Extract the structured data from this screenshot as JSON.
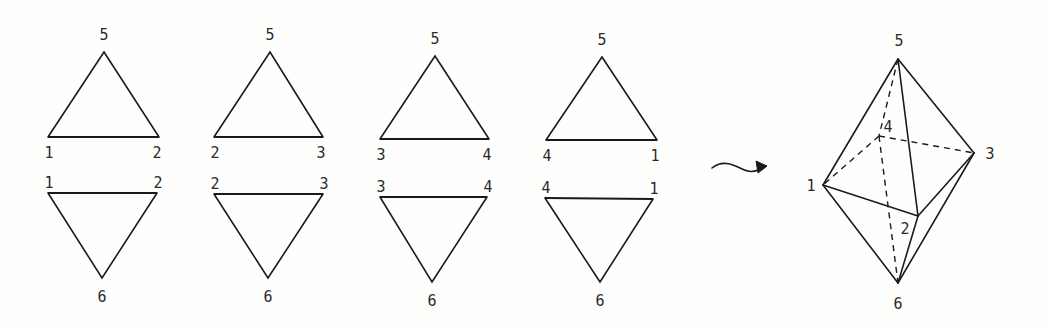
{
  "figure": {
    "nets": [
      {
        "upper": {
          "apex": {
            "label": "5",
            "x": 104,
            "y": 52
          },
          "left": {
            "label": "1",
            "x": 48,
            "y": 137
          },
          "right": {
            "label": "2",
            "x": 159,
            "y": 137
          }
        },
        "lower": {
          "left": {
            "label": "1",
            "x": 48,
            "y": 193
          },
          "right": {
            "label": "2",
            "x": 157,
            "y": 193
          },
          "bottom": {
            "label": "6",
            "x": 102,
            "y": 278
          }
        }
      },
      {
        "upper": {
          "apex": {
            "label": "5",
            "x": 270,
            "y": 52
          },
          "left": {
            "label": "2",
            "x": 214,
            "y": 137
          },
          "right": {
            "label": "3",
            "x": 323,
            "y": 137
          }
        },
        "lower": {
          "left": {
            "label": "2",
            "x": 214,
            "y": 194
          },
          "right": {
            "label": "3",
            "x": 323,
            "y": 194
          },
          "bottom": {
            "label": "6",
            "x": 268,
            "y": 278
          }
        }
      },
      {
        "upper": {
          "apex": {
            "label": "5",
            "x": 435,
            "y": 56
          },
          "left": {
            "label": "3",
            "x": 380,
            "y": 139
          },
          "right": {
            "label": "4",
            "x": 489,
            "y": 139
          }
        },
        "lower": {
          "left": {
            "label": "3",
            "x": 380,
            "y": 197
          },
          "right": {
            "label": "4",
            "x": 487,
            "y": 197
          },
          "bottom": {
            "label": "6",
            "x": 432,
            "y": 282
          }
        }
      },
      {
        "upper": {
          "apex": {
            "label": "5",
            "x": 602,
            "y": 57
          },
          "left": {
            "label": "4",
            "x": 546,
            "y": 140
          },
          "right": {
            "label": "1",
            "x": 657,
            "y": 140
          }
        },
        "lower": {
          "left": {
            "label": "4",
            "x": 545,
            "y": 198
          },
          "right": {
            "label": "1",
            "x": 653,
            "y": 199
          },
          "bottom": {
            "label": "6",
            "x": 600,
            "y": 282
          }
        }
      }
    ],
    "arrow": {
      "symbol": "wavy-arrow",
      "from": [
        712,
        168
      ],
      "to": [
        766,
        168
      ]
    },
    "octahedron": {
      "vertices": {
        "5": {
          "x": 898,
          "y": 59
        },
        "4": {
          "x": 879,
          "y": 136
        },
        "3": {
          "x": 974,
          "y": 153
        },
        "1": {
          "x": 823,
          "y": 185
        },
        "2": {
          "x": 918,
          "y": 216
        },
        "6": {
          "x": 898,
          "y": 283
        }
      },
      "solid_edges": [
        [
          "5",
          "1"
        ],
        [
          "5",
          "2"
        ],
        [
          "5",
          "3"
        ],
        [
          "1",
          "2"
        ],
        [
          "2",
          "3"
        ],
        [
          "1",
          "6"
        ],
        [
          "2",
          "6"
        ],
        [
          "3",
          "6"
        ]
      ],
      "hidden_edges": [
        [
          "5",
          "4"
        ],
        [
          "4",
          "1"
        ],
        [
          "4",
          "3"
        ],
        [
          "4",
          "6"
        ]
      ],
      "labels": {
        "5": "5",
        "4": "4",
        "3": "3",
        "1": "1",
        "2": "2",
        "6": "6"
      }
    }
  }
}
